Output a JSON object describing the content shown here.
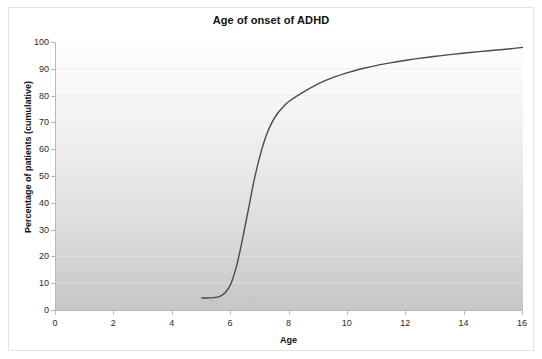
{
  "chart_data": {
    "type": "line",
    "title": "Age of onset of ADHD",
    "xlabel": "Age",
    "ylabel": "Percentage of patients (cumulative)",
    "xlim": [
      0,
      16
    ],
    "ylim": [
      0,
      100
    ],
    "xticks": [
      0,
      2,
      4,
      6,
      8,
      10,
      12,
      14,
      16
    ],
    "xtick_labels": [
      "0",
      "2",
      "4",
      "6",
      "8",
      "10",
      "12",
      "14",
      "16"
    ],
    "yticks": [
      0,
      10,
      20,
      30,
      40,
      50,
      60,
      70,
      80,
      90,
      100
    ],
    "ytick_labels": [
      "0",
      "10",
      "20",
      "30",
      "40",
      "50",
      "60",
      "70",
      "80",
      "90",
      "100"
    ],
    "grid": true,
    "legend": null,
    "line_color": "#4a4a4a",
    "series": [
      {
        "name": "Cumulative percentage of patients",
        "x": [
          5.0,
          5.2,
          5.4,
          5.6,
          5.8,
          6.0,
          6.2,
          6.4,
          6.6,
          6.8,
          7.0,
          7.2,
          7.4,
          7.6,
          7.8,
          8.0,
          8.5,
          9.0,
          9.5,
          10.0,
          10.5,
          11.0,
          11.5,
          12.0,
          12.5,
          13.0,
          13.5,
          14.0,
          14.5,
          15.0,
          15.5,
          16.0
        ],
        "y": [
          4.5,
          4.5,
          4.6,
          5.0,
          6.5,
          10.0,
          17.0,
          27.0,
          38.0,
          49.0,
          58.0,
          65.0,
          70.0,
          73.5,
          76.0,
          78.0,
          81.5,
          84.5,
          86.8,
          88.6,
          90.1,
          91.3,
          92.3,
          93.2,
          94.0,
          94.7,
          95.3,
          95.9,
          96.4,
          96.9,
          97.4,
          98.0
        ]
      }
    ]
  },
  "figure": {
    "background_color": "#ffffff",
    "plot_gradient_top": "#fdfdfd",
    "plot_gradient_bottom": "#c6c6c6",
    "frame_color": "#e2e2e2",
    "axis_color": "#b9b9b9"
  }
}
